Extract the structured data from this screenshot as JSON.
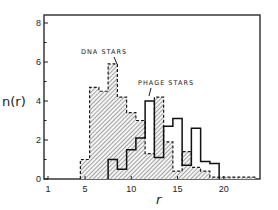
{
  "chart_data": {
    "type": "bar",
    "subtype": "step-histogram",
    "title": "",
    "xlabel": "r",
    "ylabel": "n(r)",
    "xlim": [
      0.5,
      24.5
    ],
    "ylim": [
      0,
      8.5
    ],
    "x_ticks": [
      1,
      5,
      10,
      15,
      20
    ],
    "x_tick_labels": [
      "1",
      "5",
      "10",
      "15",
      "20"
    ],
    "y_ticks": [
      0,
      2,
      4,
      6,
      8
    ],
    "y_tick_labels": [
      "0",
      "2",
      "4",
      "6",
      "8"
    ],
    "grid": false,
    "legend": "inline annotations",
    "series": [
      {
        "name": "DNA STARS",
        "style": "dashed outline, hatched fill",
        "x": [
          5,
          6,
          7,
          8,
          9,
          10,
          11,
          12,
          13,
          14,
          15,
          16,
          17,
          18,
          19,
          20,
          21,
          22,
          23
        ],
        "values": [
          1.0,
          4.7,
          4.5,
          5.9,
          4.2,
          3.4,
          3.0,
          1.3,
          4.2,
          1.9,
          0.4,
          1.4,
          0.6,
          0.4,
          0.1,
          0.1,
          0.1,
          0.1,
          0.1
        ]
      },
      {
        "name": "PHAGE STARS",
        "style": "solid outline, no fill",
        "x": [
          8,
          9,
          10,
          11,
          12,
          13,
          14,
          15,
          16,
          17,
          18,
          19
        ],
        "values": [
          1.0,
          0.5,
          1.5,
          2.1,
          4.0,
          1.1,
          2.7,
          3.1,
          0.7,
          2.6,
          0.9,
          0.8
        ]
      }
    ],
    "annotations": [
      {
        "text": "DNA STARS",
        "points_to_x": 8
      },
      {
        "text": "PHAGE STARS",
        "points_to_x": 12
      }
    ]
  },
  "labels": {
    "ylabel": "n(r)",
    "xlabel": "r",
    "dna_annotation": "DNA STARS",
    "phage_annotation": "PHAGE STARS"
  }
}
